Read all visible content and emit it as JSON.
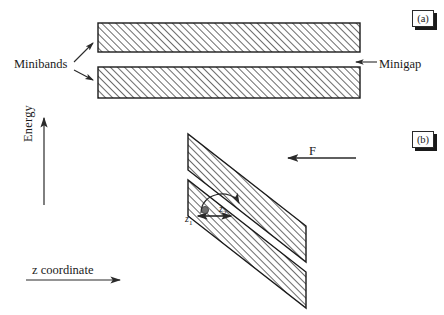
{
  "figure": {
    "background_color": "#ffffff",
    "ink_color": "#1a1a1a",
    "hatch_color": "#3a3a3a"
  },
  "panel_a": {
    "tag": "(a)",
    "description": "Two flat horizontal hatched minibands separated by a minigap",
    "labels": {
      "minibands": "Minibands",
      "minigap": "Minigap"
    },
    "bands": [
      {
        "name": "upper-miniband",
        "x": 98,
        "y": 23,
        "width": 262,
        "height": 29
      },
      {
        "name": "lower-miniband",
        "x": 98,
        "y": 67,
        "width": 262,
        "height": 31
      }
    ],
    "minigap": {
      "top": 52,
      "bottom": 67,
      "height": 15
    },
    "leader_arrows": [
      {
        "name": "minibands-arrow-upper",
        "x1": 74,
        "y1": 62,
        "x2": 93,
        "y2": 43
      },
      {
        "name": "minibands-arrow-lower",
        "x1": 74,
        "y1": 70,
        "x2": 93,
        "y2": 80
      }
    ],
    "minigap_arrow": {
      "x1": 377,
      "y1": 62,
      "x2": 354,
      "y2": 62,
      "direction": "left"
    }
  },
  "panel_b": {
    "tag": "(b)",
    "description": "Two tilted hatched minibands under an applied electric field, with a Zener tunneling transition from z1 to z2",
    "labels": {
      "force": "F",
      "z1": "z",
      "z1_sub": "1",
      "z2": "z",
      "z2_sub": "2"
    },
    "force_arrow": {
      "x1": 355,
      "y1": 158,
      "x2": 288,
      "y2": 158,
      "direction": "left"
    },
    "tilt": {
      "dx": 118,
      "dy": 186,
      "slope_note": "bands descend to the right"
    },
    "bands": [
      {
        "name": "upper-tilted-miniband",
        "top_left_x": 188,
        "top_y": 134,
        "band_thickness_px": 26
      },
      {
        "name": "lower-tilted-miniband",
        "top_left_x": 188,
        "top_y": 180,
        "band_thickness_px": 26
      }
    ],
    "transition": {
      "electron_dot": {
        "x": 205,
        "y": 210,
        "r": 3.6
      },
      "double_arrow": {
        "x1": 196,
        "y1": 216,
        "x2": 232,
        "y2": 216
      },
      "curved_arrow": {
        "from_x": 202,
        "from_y": 212,
        "to_x": 240,
        "to_y": 208,
        "style": "arc-over-right"
      }
    }
  },
  "axes": {
    "energy": {
      "label": "Energy",
      "direction": "up",
      "x": 44,
      "y_top": 118,
      "y_bottom": 205
    },
    "z_coordinate": {
      "label": "z coordinate",
      "direction": "right",
      "y": 280,
      "x_left": 26,
      "x_right": 118
    }
  }
}
